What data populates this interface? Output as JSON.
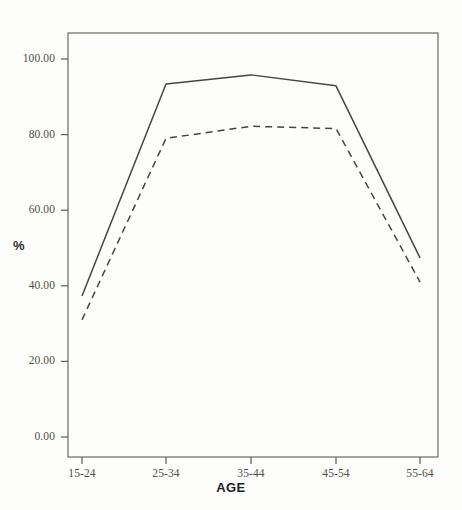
{
  "chart_data": {
    "type": "line",
    "title": "",
    "subtitle": "",
    "xlabel": "AGE",
    "ylabel": "%",
    "categories": [
      "15-24",
      "25-34",
      "35-44",
      "45-54",
      "55-64"
    ],
    "series": [
      {
        "name": "solid-line",
        "style": "solid",
        "color": "#46463e",
        "values": [
          37.3,
          93.4,
          95.8,
          92.9,
          47.4
        ]
      },
      {
        "name": "dashed-line",
        "style": "dashed",
        "color": "#46463e",
        "values": [
          31.0,
          79.0,
          82.2,
          81.6,
          41.0
        ]
      }
    ],
    "ylim": [
      0,
      108
    ],
    "yticks": [
      0,
      20,
      40,
      60,
      80,
      100
    ],
    "ytick_labels": [
      "0.00",
      "20.00",
      "40.00",
      "60.00",
      "80.00",
      "100.00"
    ],
    "xtick_labels": [
      "15-24",
      "25-34",
      "35-44",
      "45-54",
      "55-64"
    ],
    "grid": false,
    "legend": "none",
    "annotations": []
  },
  "axes": {
    "y_title": "%",
    "x_title": "AGE"
  },
  "colors": {
    "line": "#46463e",
    "frame": "#6b6b5e",
    "tick_text": "#4f4f47",
    "background": "#fdfdfb"
  }
}
